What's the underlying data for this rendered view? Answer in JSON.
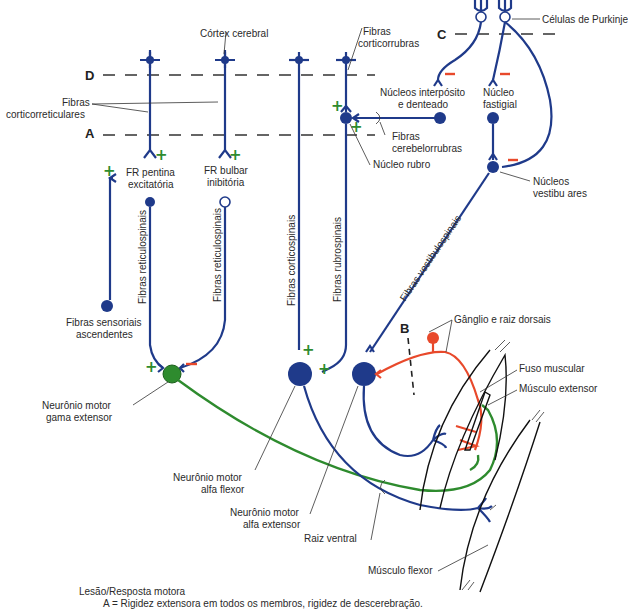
{
  "labels": {
    "cortex": "Córtex cerebral",
    "corticorrubras_1": "Fibras",
    "corticorrubras_2": "corticorrubras",
    "purkinje": "Células de Purkinje",
    "corticorreticulares_1": "Fibras",
    "corticorreticulares_2": "corticorreticulares",
    "interposito_1": "Núcleos interpósito",
    "interposito_2": "e denteado",
    "fastigial_1": "Núcleo",
    "fastigial_2": "fastigial",
    "cerebelorrubras_1": "Fibras",
    "cerebelorrubras_2": "cerebelorrubras",
    "rubro": "Núcleo rubro",
    "fr_pontina_1": "FR pentina",
    "fr_pontina_2": "excitatória",
    "fr_bulbar_1": "FR bulbar",
    "fr_bulbar_2": "inibitória",
    "vestibulares_1": "Núcleos",
    "vestibulares_2": "vestibu ares",
    "reticulospinais_1": "Fibras reticulospinais",
    "reticulospinais_2": "Fibras reticulospinais",
    "corticospinais": "Fibras corticospinais",
    "rubrospinais": "Fibras rubrospinais",
    "vestibulospinais": "Fibras vestibulospinais",
    "sensoriais_1": "Fibras sensoriais",
    "sensoriais_2": "ascendentes",
    "ganglio": "Gânglio e raiz dorsais",
    "fuso": "Fuso muscular",
    "musculo_extensor": "Músculo extensor",
    "gama_1": "Neurônio motor",
    "gama_2": "gama extensor",
    "alfa_flexor_1": "Neurônio motor",
    "alfa_flexor_2": "alfa flexor",
    "alfa_extensor_1": "Neurônio motor",
    "alfa_extensor_2": "alfa extensor",
    "raiz_ventral": "Raiz ventral",
    "musculo_flexor": "Músculo flexor"
  },
  "levels": {
    "A": "A",
    "B": "B",
    "C": "C",
    "D": "D"
  },
  "signs": {
    "plus": "+",
    "minus": "−"
  },
  "caption": {
    "title": "Lesão/Resposta motora",
    "line_a": "A = Rigidez extensora em todos os membros, rigidez de descerebração."
  },
  "colors": {
    "neuron_blue": "#1f3a8a",
    "gamma_green": "#2e8b2e",
    "sensory_red": "#e8492b"
  }
}
